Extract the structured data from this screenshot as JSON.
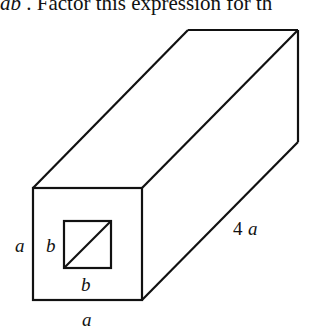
{
  "header": {
    "prefix_italic": "ab",
    "text": " . Factor this expression for th"
  },
  "diagram": {
    "type": "rectangular prism with square hole",
    "stroke_color": "#111111",
    "labels": {
      "outer_side": "a",
      "outer_bottom": "a",
      "inner_side": "b",
      "inner_bottom": "b",
      "length_num": "4",
      "length_var": "a"
    }
  }
}
